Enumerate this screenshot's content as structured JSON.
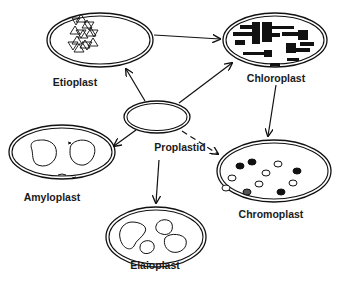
{
  "diagram": {
    "nodes": [
      {
        "id": "etioplast",
        "label": "Etioplast",
        "cx": 100,
        "cy": 40,
        "rx": 53,
        "ry": 27,
        "label_x": 75,
        "label_y": 76
      },
      {
        "id": "chloroplast",
        "label": "Chloroplast",
        "cx": 275,
        "cy": 40,
        "rx": 52,
        "ry": 27,
        "label_x": 276,
        "label_y": 72
      },
      {
        "id": "proplastid",
        "label": "Proplastid",
        "cx": 157,
        "cy": 117,
        "rx": 33,
        "ry": 16,
        "label_x": 180,
        "label_y": 141
      },
      {
        "id": "amyloplast",
        "label": "Amyloplast",
        "cx": 62,
        "cy": 152,
        "rx": 53,
        "ry": 27,
        "label_x": 52,
        "label_y": 191
      },
      {
        "id": "chromoplast",
        "label": "Chromoplast",
        "cx": 274,
        "cy": 171,
        "rx": 57,
        "ry": 31,
        "label_x": 271,
        "label_y": 208
      },
      {
        "id": "elaioplast",
        "label": "Elaioplast",
        "cx": 156,
        "cy": 237,
        "rx": 50,
        "ry": 30,
        "label_x": 155,
        "label_y": 259
      }
    ],
    "edges": [
      {
        "from": "etioplast",
        "to": "chloroplast",
        "style": "solid"
      },
      {
        "from": "proplastid",
        "to": "etioplast",
        "style": "solid"
      },
      {
        "from": "proplastid",
        "to": "chloroplast",
        "style": "solid"
      },
      {
        "from": "proplastid",
        "to": "amyloplast",
        "style": "solid"
      },
      {
        "from": "proplastid",
        "to": "elaioplast",
        "style": "solid"
      },
      {
        "from": "proplastid",
        "to": "chromoplast",
        "style": "dashed"
      },
      {
        "from": "chloroplast",
        "to": "chromoplast",
        "style": "solid"
      }
    ]
  }
}
